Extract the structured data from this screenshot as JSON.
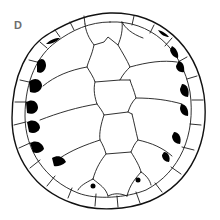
{
  "figure": {
    "panel_label": "D",
    "colors": {
      "background": "#ffffff",
      "line": "#111111",
      "fill_marks": "#000000",
      "label": "#6e6e6e"
    },
    "regions": {
      "vertebral_scutes": 5,
      "costal_scutes_per_side": 4,
      "marginal_ring": "outer ring of marginal scutes",
      "black_marks": "black crescent-shaped marks along inner margin of marginal ring on both sides, plus two small dots near posterior"
    }
  }
}
